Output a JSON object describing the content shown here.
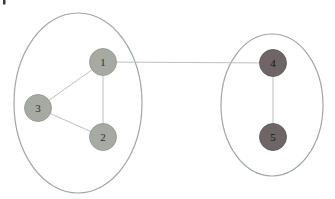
{
  "diagram": {
    "canvas": {
      "width": 335,
      "height": 199,
      "background": "#ffffff"
    },
    "clusters": [
      {
        "id": "left",
        "cx": 78,
        "cy": 103,
        "rx": 64,
        "ry": 90,
        "stroke": "#a0a6a6"
      },
      {
        "id": "right",
        "cx": 272,
        "cy": 105,
        "rx": 51,
        "ry": 71,
        "stroke": "#a0a6a6"
      }
    ],
    "nodes": [
      {
        "id": "1",
        "label": "1",
        "x": 103,
        "y": 62,
        "r": 13.5,
        "fill": "#a6aaa2",
        "stroke": "#8f948b",
        "text_color": "#2f2f2f"
      },
      {
        "id": "2",
        "label": "2",
        "x": 103,
        "y": 137,
        "r": 13.5,
        "fill": "#a6aaa2",
        "stroke": "#8f948b",
        "text_color": "#2f2f2f"
      },
      {
        "id": "3",
        "label": "3",
        "x": 38,
        "y": 108,
        "r": 13.5,
        "fill": "#a6aaa2",
        "stroke": "#8f948b",
        "text_color": "#2f2f2f"
      },
      {
        "id": "4",
        "label": "4",
        "x": 273,
        "y": 63,
        "r": 13.5,
        "fill": "#6e6666",
        "stroke": "#5c5555",
        "text_color": "#151515"
      },
      {
        "id": "5",
        "label": "5",
        "x": 273,
        "y": 137,
        "r": 13.5,
        "fill": "#6e6666",
        "stroke": "#5c5555",
        "text_color": "#151515"
      }
    ],
    "edges": [
      {
        "from": "1",
        "to": "3"
      },
      {
        "from": "3",
        "to": "2"
      },
      {
        "from": "1",
        "to": "2"
      },
      {
        "from": "1",
        "to": "4"
      },
      {
        "from": "4",
        "to": "5"
      }
    ],
    "edge_color": "#bcc0bc",
    "artifact": {
      "x": 3,
      "y": 0,
      "width": 2.5,
      "height": 4.5,
      "color": "#3a3a3a"
    }
  }
}
